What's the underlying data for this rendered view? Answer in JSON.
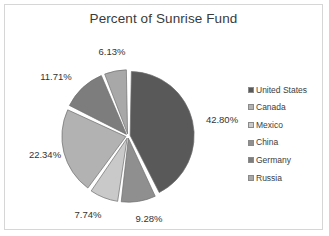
{
  "chart": {
    "title": "Percent of Sunrise Fund",
    "frame_border_color": "#d6d6d6",
    "background": "#ffffff"
  },
  "legend": {
    "position": "right",
    "items": [
      {
        "label": "United States",
        "color": "#595959"
      },
      {
        "label": "Canada",
        "color": "#b2b2b2"
      },
      {
        "label": "Mexico",
        "color": "#c9c9c9"
      },
      {
        "label": "China",
        "color": "#8f8f8f"
      },
      {
        "label": "Germany",
        "color": "#7d7d7d"
      },
      {
        "label": "Russia",
        "color": "#a8a8a8"
      }
    ]
  },
  "chart_data": {
    "type": "pie",
    "title": "Percent of Sunrise Fund",
    "categories": [
      "United States",
      "China",
      "Mexico",
      "Canada",
      "Germany",
      "Russia"
    ],
    "values": [
      42.8,
      9.28,
      7.74,
      22.34,
      11.71,
      6.13
    ],
    "labels": [
      "42.80%",
      "9.28%",
      "7.74%",
      "22.34%",
      "11.71%",
      "6.13%"
    ],
    "colors": [
      "#595959",
      "#8f8f8f",
      "#c9c9c9",
      "#b2b2b2",
      "#7d7d7d",
      "#a8a8a8"
    ],
    "legend_order": [
      "United States",
      "Canada",
      "Mexico",
      "China",
      "Germany",
      "Russia"
    ],
    "units": "percent",
    "start_angle_deg": 0,
    "direction": "clockwise",
    "exploded": true,
    "slice_gap": true,
    "total": 100.0,
    "center": {
      "x": 123,
      "y": 131
    },
    "radius": 64,
    "label_positions": [
      {
        "label": "42.80%",
        "x": 217,
        "y": 114
      },
      {
        "label": "9.28%",
        "x": 144,
        "y": 213
      },
      {
        "label": "7.74%",
        "x": 83,
        "y": 209
      },
      {
        "label": "22.34%",
        "x": 40,
        "y": 149
      },
      {
        "label": "11.71%",
        "x": 51,
        "y": 71
      },
      {
        "label": "6.13%",
        "x": 107,
        "y": 46
      }
    ]
  }
}
